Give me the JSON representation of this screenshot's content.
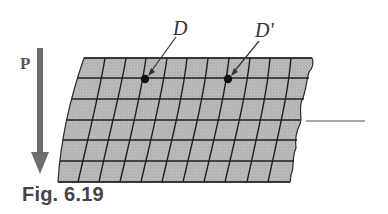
{
  "figure": {
    "caption": "Fig. 6.19",
    "load_label": "P",
    "point_labels": [
      "D",
      "D'"
    ]
  },
  "colors": {
    "arrow": "#6e6e6e",
    "mesh_fill": "#b9b9b9",
    "grid_line": "#1f1f1f",
    "text": "#333333"
  }
}
